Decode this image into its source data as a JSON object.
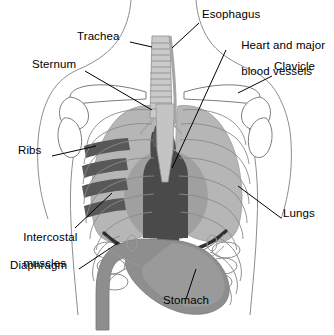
{
  "diagram": {
    "type": "anatomical-illustration",
    "view": "anterior-frontal",
    "background_color": "#ffffff",
    "palette": {
      "outline": "#8d8d8d",
      "bone_light": "#b8b8b8",
      "lung_gray": "#b4b4b4",
      "rib_gray": "#bcbcbc",
      "intercostal_dark": "#545454",
      "heart_dark": "#4a4a4a",
      "stomach_gray": "#8e8e8e",
      "diaphragm_line": "#2e2e2e",
      "label_text": "#000000"
    },
    "labels": [
      {
        "id": "esophagus",
        "text": "Esophagus",
        "x": 202,
        "y": 14,
        "align": "left",
        "leader": {
          "x1": 199,
          "y1": 23,
          "x2": 172,
          "y2": 48
        }
      },
      {
        "id": "heart-and-major-blood-vessels",
        "text": "Heart and major",
        "text_line2": "blood vessels",
        "x": 228,
        "y": 33,
        "align": "left",
        "leader": {
          "x1": 226,
          "y1": 50,
          "x2": 172,
          "y2": 168
        }
      },
      {
        "id": "clavicle",
        "text": "Clavicle",
        "x": 274,
        "y": 66,
        "align": "left",
        "leader": {
          "x1": 272,
          "y1": 76,
          "x2": 238,
          "y2": 93
        }
      },
      {
        "id": "trachea",
        "text": "Trachea",
        "x": 77,
        "y": 36,
        "align": "left",
        "leader": {
          "x1": 130,
          "y1": 42,
          "x2": 152,
          "y2": 47
        }
      },
      {
        "id": "sternum",
        "text": "Sternum",
        "x": 32,
        "y": 64,
        "align": "left",
        "leader": {
          "x1": 85,
          "y1": 71,
          "x2": 152,
          "y2": 110
        }
      },
      {
        "id": "ribs",
        "text": "Ribs",
        "x": 18,
        "y": 150,
        "align": "left",
        "leader": {
          "x1": 52,
          "y1": 156,
          "x2": 96,
          "y2": 146
        }
      },
      {
        "id": "intercostal-muscles",
        "text": "Intercostal",
        "text_line2": "muscles",
        "x": 10,
        "y": 224,
        "align": "left",
        "leader": {
          "x1": 75,
          "y1": 228,
          "x2": 112,
          "y2": 193
        }
      },
      {
        "id": "diaphragm",
        "text": "Diaphragm",
        "x": 10,
        "y": 265,
        "align": "left",
        "leader": {
          "x1": 79,
          "y1": 269,
          "x2": 118,
          "y2": 243
        }
      },
      {
        "id": "lungs",
        "text": "Lungs",
        "x": 283,
        "y": 213,
        "align": "left",
        "leader": {
          "x1": 281,
          "y1": 218,
          "x2": 238,
          "y2": 186
        }
      },
      {
        "id": "stomach",
        "text": "Stomach",
        "x": 163,
        "y": 300,
        "align": "left",
        "leader": {
          "x1": 186,
          "y1": 299,
          "x2": 196,
          "y2": 269
        }
      }
    ],
    "structures": [
      {
        "id": "trachea",
        "label": "Trachea",
        "color": "#c6c6c6"
      },
      {
        "id": "esophagus",
        "label": "Esophagus",
        "color": "#b0b0b0"
      },
      {
        "id": "left-lung",
        "label": "Lung",
        "color": "#b4b4b4"
      },
      {
        "id": "right-lung",
        "label": "Lung",
        "color": "#b4b4b4"
      },
      {
        "id": "heart",
        "label": "Heart and major blood vessels",
        "color": "#4a4a4a"
      },
      {
        "id": "sternum",
        "label": "Sternum",
        "color": "#c0c0c0"
      },
      {
        "id": "clavicle",
        "label": "Clavicle",
        "color": "#ffffff"
      },
      {
        "id": "ribs",
        "label": "Ribs",
        "color": "#bcbcbc"
      },
      {
        "id": "intercostal-muscles",
        "label": "Intercostal muscles",
        "color": "#545454"
      },
      {
        "id": "diaphragm",
        "label": "Diaphragm",
        "color": "#2e2e2e"
      },
      {
        "id": "stomach",
        "label": "Stomach",
        "color": "#8e8e8e"
      }
    ]
  }
}
